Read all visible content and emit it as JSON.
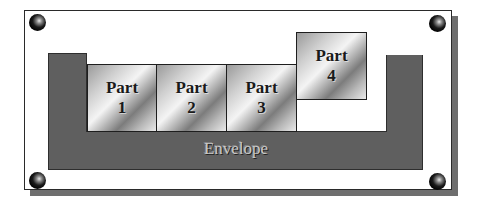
{
  "diagram": {
    "envelope": {
      "label": "Envelope",
      "fill_color": "#5f5f5f"
    },
    "parts": [
      {
        "title": "Part",
        "number": "1"
      },
      {
        "title": "Part",
        "number": "2"
      },
      {
        "title": "Part",
        "number": "3"
      },
      {
        "title": "Part",
        "number": "4"
      }
    ],
    "frame": {
      "background_color": "#ffffff",
      "shadow_color": "#6e6e6e",
      "screws": [
        "top-left",
        "top-right",
        "bottom-left",
        "bottom-right"
      ]
    }
  }
}
